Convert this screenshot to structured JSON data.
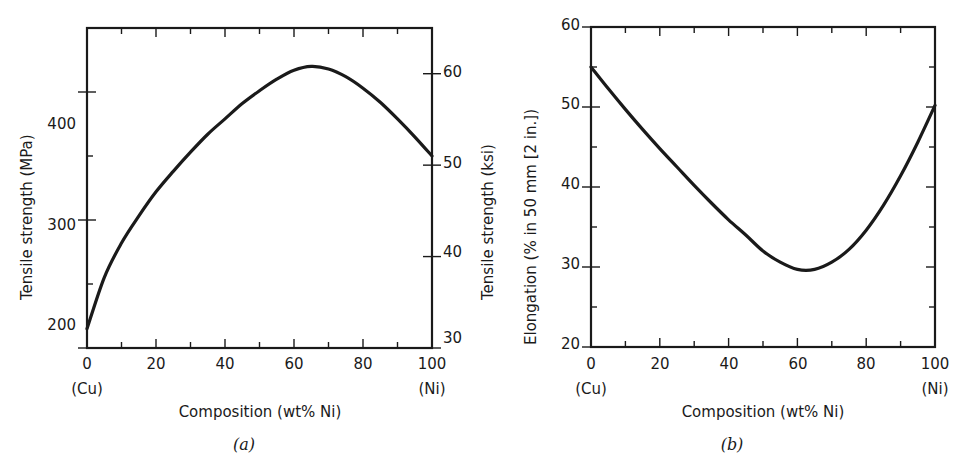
{
  "figure": {
    "background": "#ffffff",
    "line_color": "#1a1a1a",
    "axis_color": "#1a1a1a"
  },
  "panel_a": {
    "sublabel": "(a)",
    "xaxis": {
      "title": "Composition (wt% Ni)",
      "tick_labels": [
        "0",
        "20",
        "40",
        "60",
        "80",
        "100"
      ],
      "left_endpoint": "(Cu)",
      "right_endpoint": "(Ni)"
    },
    "yaxis_left": {
      "title": "Tensile strength (MPa)",
      "tick_labels": [
        "200",
        "300",
        "400"
      ]
    },
    "yaxis_right": {
      "title": "Tensile strength (ksi)",
      "tick_labels": [
        "30",
        "40",
        "50",
        "60"
      ]
    },
    "chart_data": {
      "type": "line",
      "title": "Tensile strength of Cu-Ni alloys vs composition",
      "xlabel": "Composition (wt% Ni)",
      "ylabel": "Tensile strength (MPa)",
      "ylabel_secondary": "Tensile strength (ksi)",
      "xlim": [
        0,
        100
      ],
      "ylim": [
        200,
        450
      ],
      "ylim_secondary": [
        30,
        65
      ],
      "xticks": [
        0,
        10,
        20,
        30,
        40,
        50,
        60,
        70,
        80,
        90,
        100
      ],
      "xticks_major": [
        0,
        20,
        40,
        60,
        80,
        100
      ],
      "yticks": [
        200,
        250,
        300,
        350,
        400
      ],
      "yticks_major": [
        200,
        300,
        400
      ],
      "yticks_secondary": [
        30,
        40,
        50,
        60
      ],
      "grid": false,
      "legend": "none",
      "x": [
        0,
        5,
        10,
        15,
        20,
        25,
        30,
        35,
        40,
        45,
        50,
        55,
        60,
        65,
        70,
        75,
        80,
        85,
        90,
        95,
        100
      ],
      "y": [
        215,
        255,
        282,
        303,
        322,
        338,
        353,
        367,
        379,
        391,
        401,
        410,
        417,
        420,
        418,
        412,
        403,
        392,
        379,
        365,
        350
      ],
      "y_secondary": [
        31.2,
        37,
        40.9,
        44,
        46.7,
        49,
        51.2,
        53.2,
        55,
        56.7,
        58.2,
        59.5,
        60.5,
        60.9,
        60.6,
        59.8,
        58.5,
        56.9,
        55,
        52.9,
        50.8
      ]
    }
  },
  "panel_b": {
    "sublabel": "(b)",
    "xaxis": {
      "title": "Composition (wt% Ni)",
      "tick_labels": [
        "0",
        "20",
        "40",
        "60",
        "80",
        "100"
      ],
      "left_endpoint": "(Cu)",
      "right_endpoint": "(Ni)"
    },
    "yaxis_left": {
      "title": "Elongation (% in 50 mm [2 in.])",
      "tick_labels": [
        "20",
        "30",
        "40",
        "50",
        "60"
      ]
    },
    "chart_data": {
      "type": "line",
      "title": "Ductility (elongation) of Cu-Ni alloys vs composition",
      "xlabel": "Composition (wt% Ni)",
      "ylabel": "Elongation (% in 50 mm [2 in.])",
      "xlim": [
        0,
        100
      ],
      "ylim": [
        20,
        60
      ],
      "xticks": [
        0,
        10,
        20,
        30,
        40,
        50,
        60,
        70,
        80,
        90,
        100
      ],
      "xticks_major": [
        0,
        20,
        40,
        60,
        80,
        100
      ],
      "yticks": [
        20,
        25,
        30,
        35,
        40,
        45,
        50,
        55,
        60
      ],
      "yticks_major": [
        20,
        30,
        40,
        50,
        60
      ],
      "grid": false,
      "legend": "none",
      "x": [
        0,
        5,
        10,
        15,
        20,
        25,
        30,
        35,
        40,
        45,
        50,
        55,
        60,
        65,
        70,
        75,
        80,
        85,
        90,
        95,
        100
      ],
      "y": [
        55.0,
        52.3,
        49.7,
        47.2,
        44.8,
        42.5,
        40.2,
        38.0,
        35.9,
        34.0,
        32.0,
        30.6,
        29.7,
        29.7,
        30.6,
        32.2,
        34.6,
        37.7,
        41.4,
        45.6,
        50.2
      ]
    }
  }
}
